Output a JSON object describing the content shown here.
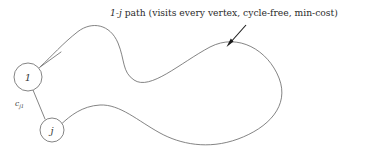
{
  "figure": {
    "background_color": "#ffffff",
    "stroke_color": "#6e6e6e",
    "text_color": "#2b2b2b",
    "pointer_color": "#1a1a1a",
    "annotation": {
      "emphasis": "1-j",
      "text": " path (visits every vertex, cycle-free, min-cost)",
      "full_text": "1-j path (visits every vertex, cycle-free, min-cost)"
    },
    "nodes": [
      {
        "id": "node-1",
        "label": "1",
        "cx": 28,
        "cy": 77,
        "r": 14
      },
      {
        "id": "node-j",
        "label": "j",
        "cx": 52,
        "cy": 130,
        "r": 12
      }
    ],
    "edge": {
      "id": "edge-j-1",
      "label_base": "c",
      "label_subscript": "j1",
      "from": "j",
      "to": "1"
    }
  }
}
